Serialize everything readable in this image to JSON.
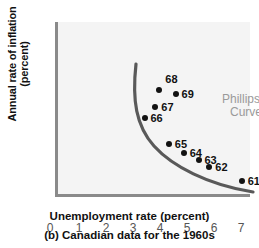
{
  "chart_data": {
    "type": "scatter",
    "title": "",
    "caption": "(b) Canadian data for the 1960s",
    "xlabel": "Unemployment rate (percent)",
    "ylabel_line1": "Annual rate of inflation",
    "ylabel_line2": "(percent)",
    "xlim": [
      0,
      7.6
    ],
    "ylim": [
      0,
      7.6
    ],
    "xticks": [
      "0",
      "1",
      "2",
      "3",
      "4",
      "5",
      "6",
      "7"
    ],
    "yticks": [
      "1",
      "2",
      "3",
      "4",
      "5",
      "6",
      "7"
    ],
    "grid": false,
    "legend": "none",
    "annotation_line1": "Phillips",
    "annotation_line2": "Curve",
    "annotation_color": "#9a9a9a",
    "point_color": "#121212",
    "curve_color": "#595959",
    "plot_background": "#f4f4f4",
    "axis_color": "#8a8a8a",
    "points": [
      {
        "label": "68",
        "x": 4.05,
        "y": 4.8,
        "lx": 6,
        "ly": -17
      },
      {
        "label": "69",
        "x": 4.65,
        "y": 4.65,
        "lx": 6,
        "ly": -6
      },
      {
        "label": "67",
        "x": 3.9,
        "y": 4.05,
        "lx": 6,
        "ly": -6
      },
      {
        "label": "66",
        "x": 3.5,
        "y": 3.55,
        "lx": 6,
        "ly": -6
      },
      {
        "label": "65",
        "x": 4.4,
        "y": 2.35,
        "lx": 6,
        "ly": -6
      },
      {
        "label": "64",
        "x": 4.95,
        "y": 1.95,
        "lx": 6,
        "ly": -6
      },
      {
        "label": "63",
        "x": 5.5,
        "y": 1.65,
        "lx": 6,
        "ly": -6
      },
      {
        "label": "62",
        "x": 5.9,
        "y": 1.3,
        "lx": 6,
        "ly": -6
      },
      {
        "label": "61",
        "x": 7.1,
        "y": 0.7,
        "lx": 6,
        "ly": -6
      }
    ],
    "curve_description": "Downward-sloping convex Phillips curve from (3.45, 5.3) to (7.4, 0.55)"
  }
}
